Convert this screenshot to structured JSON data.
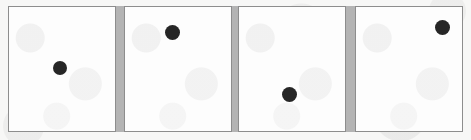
{
  "figure": {
    "width": 471,
    "height": 140,
    "background_color": "#f7f7f6",
    "panel_fill_color": "#fdfdfd",
    "panel_border_color": "#8d8d8d",
    "dot_color": "#262626",
    "divider_color": "#b4b4b4",
    "panel_count": 4,
    "dot_count_per_panel": 1
  },
  "panels": [
    {
      "id": "panel-1",
      "index": 1,
      "label": "1",
      "x": 8,
      "y": 6,
      "width": 108,
      "height": 126,
      "dot": {
        "id": "dot-1",
        "cx": 60,
        "cy": 68,
        "diameter": 14,
        "rel_x": 0.48,
        "rel_y": 0.49,
        "position_name": "center-left"
      }
    },
    {
      "id": "panel-2",
      "index": 2,
      "label": "2",
      "x": 124,
      "y": 6,
      "width": 108,
      "height": 126,
      "dot": {
        "id": "dot-2",
        "cx": 173,
        "cy": 33,
        "diameter": 15,
        "rel_x": 0.45,
        "rel_y": 0.21,
        "position_name": "upper-center"
      }
    },
    {
      "id": "panel-3",
      "index": 3,
      "label": "3",
      "x": 238,
      "y": 6,
      "width": 108,
      "height": 126,
      "dot": {
        "id": "dot-3",
        "cx": 290,
        "cy": 95,
        "diameter": 15,
        "rel_x": 0.48,
        "rel_y": 0.71,
        "position_name": "lower-center"
      }
    },
    {
      "id": "panel-4",
      "index": 4,
      "label": "4",
      "x": 355,
      "y": 6,
      "width": 108,
      "height": 126,
      "dot": {
        "id": "dot-4",
        "cx": 443,
        "cy": 28,
        "diameter": 15,
        "rel_x": 0.81,
        "rel_y": 0.17,
        "position_name": "upper-right"
      }
    }
  ],
  "dividers": [
    {
      "id": "divider-1",
      "x": 116,
      "y": 6,
      "width": 8,
      "height": 126
    },
    {
      "id": "divider-2",
      "x": 232,
      "y": 6,
      "width": 6,
      "height": 126
    },
    {
      "id": "divider-3",
      "x": 346,
      "y": 6,
      "width": 9,
      "height": 126
    }
  ]
}
